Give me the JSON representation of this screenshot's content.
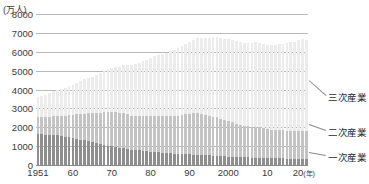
{
  "chart_data": {
    "type": "bar",
    "stacked": true,
    "title": "",
    "subtitle": "",
    "xlabel": "",
    "ylabel": "",
    "unit_label": "(万人)",
    "year_suffix": "(年)",
    "ylim": [
      0,
      8000
    ],
    "ytick_labels": [
      "8000",
      "7000",
      "6000",
      "5000",
      "4000",
      "3000",
      "2000",
      "1000",
      "0"
    ],
    "ytick_values": [
      8000,
      7000,
      6000,
      5000,
      4000,
      3000,
      2000,
      1000,
      0
    ],
    "grid": true,
    "legend_position": "right",
    "xtick_labels": [
      "1951",
      "60",
      "70",
      "80",
      "90",
      "2000",
      "10",
      "20"
    ],
    "xtick_years": [
      1951,
      1960,
      1970,
      1980,
      1990,
      2000,
      2010,
      2020
    ],
    "x": [
      1951,
      1952,
      1953,
      1954,
      1955,
      1956,
      1957,
      1958,
      1959,
      1960,
      1961,
      1962,
      1963,
      1964,
      1965,
      1966,
      1967,
      1968,
      1969,
      1970,
      1971,
      1972,
      1973,
      1974,
      1975,
      1976,
      1977,
      1978,
      1979,
      1980,
      1981,
      1982,
      1983,
      1984,
      1985,
      1986,
      1987,
      1988,
      1989,
      1990,
      1991,
      1992,
      1993,
      1994,
      1995,
      1996,
      1997,
      1998,
      1999,
      2000,
      2001,
      2002,
      2003,
      2004,
      2005,
      2006,
      2007,
      2008,
      2009,
      2010,
      2011,
      2012,
      2013,
      2014,
      2015,
      2016,
      2017,
      2018,
      2019,
      2020
    ],
    "series": [
      {
        "name": "一次産業",
        "color": "#8f8f8f",
        "values": [
          1660,
          1630,
          1600,
          1580,
          1610,
          1570,
          1540,
          1500,
          1470,
          1450,
          1400,
          1350,
          1300,
          1250,
          1200,
          1160,
          1120,
          1080,
          1030,
          1010,
          960,
          920,
          880,
          840,
          810,
          790,
          770,
          750,
          730,
          710,
          690,
          670,
          650,
          630,
          620,
          600,
          590,
          580,
          570,
          560,
          550,
          540,
          530,
          520,
          510,
          500,
          490,
          480,
          470,
          450,
          440,
          430,
          420,
          410,
          400,
          390,
          385,
          380,
          375,
          370,
          365,
          360,
          355,
          350,
          345,
          340,
          335,
          330,
          325,
          320
        ]
      },
      {
        "name": "二次産業",
        "color": "#c4c4c4",
        "values": [
          870,
          900,
          930,
          960,
          990,
          1030,
          1080,
          1120,
          1160,
          1210,
          1290,
          1360,
          1420,
          1490,
          1530,
          1590,
          1660,
          1730,
          1790,
          1820,
          1830,
          1820,
          1860,
          1840,
          1800,
          1810,
          1830,
          1850,
          1880,
          1910,
          1930,
          1940,
          1950,
          1970,
          1990,
          2010,
          2030,
          2080,
          2130,
          2150,
          2200,
          2220,
          2190,
          2140,
          2090,
          2050,
          2030,
          1970,
          1910,
          1870,
          1820,
          1760,
          1710,
          1680,
          1660,
          1640,
          1640,
          1620,
          1560,
          1530,
          1510,
          1500,
          1490,
          1480,
          1470,
          1470,
          1470,
          1480,
          1480,
          1460
        ]
      },
      {
        "name": "三次産業",
        "color": "#ececec",
        "values": [
          1080,
          1140,
          1200,
          1250,
          1300,
          1360,
          1420,
          1480,
          1540,
          1600,
          1670,
          1740,
          1820,
          1890,
          1960,
          2030,
          2100,
          2180,
          2250,
          2320,
          2400,
          2470,
          2560,
          2610,
          2680,
          2750,
          2820,
          2900,
          2980,
          3060,
          3130,
          3200,
          3290,
          3350,
          3410,
          3490,
          3560,
          3640,
          3710,
          3790,
          3880,
          3960,
          4030,
          4090,
          4140,
          4210,
          4280,
          4300,
          4320,
          4360,
          4380,
          4360,
          4370,
          4390,
          4420,
          4450,
          4490,
          4490,
          4470,
          4480,
          4490,
          4510,
          4560,
          4600,
          4650,
          4700,
          4740,
          4810,
          4870,
          4860
        ]
      }
    ],
    "legend": [
      {
        "label": "三次産業",
        "color": "#ececec"
      },
      {
        "label": "二次産業",
        "color": "#c4c4c4"
      },
      {
        "label": "一次産業",
        "color": "#8f8f8f"
      }
    ]
  }
}
